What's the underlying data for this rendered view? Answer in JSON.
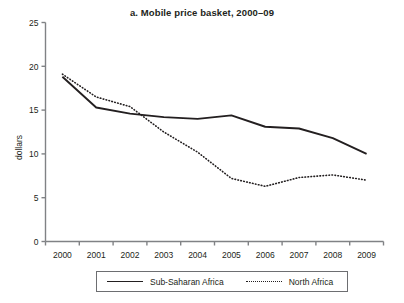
{
  "chart_data": {
    "type": "line",
    "title": "a. Mobile price basket, 2000–09",
    "xlabel": "",
    "ylabel": "dollars",
    "categories": [
      "2000",
      "2001",
      "2002",
      "2003",
      "2004",
      "2005",
      "2006",
      "2007",
      "2008",
      "2009"
    ],
    "x_tick_labels": [
      "2000",
      "2001",
      "2002",
      "2003",
      "2004",
      "2005",
      "2006",
      "2007",
      "2008",
      "2009"
    ],
    "y_tick_labels": [
      "0",
      "5",
      "10",
      "15",
      "20",
      "25"
    ],
    "y_ticks": [
      0,
      5,
      10,
      15,
      20,
      25
    ],
    "ylim": [
      0,
      25
    ],
    "grid": false,
    "legend_position": "bottom",
    "series": [
      {
        "name": "Sub-Saharan Africa",
        "style": "solid",
        "color": "#231f20",
        "values": [
          18.8,
          15.3,
          14.6,
          14.2,
          14.0,
          14.4,
          13.1,
          12.9,
          11.8,
          10.0
        ]
      },
      {
        "name": "North Africa",
        "style": "dotted",
        "color": "#231f20",
        "values": [
          19.1,
          16.5,
          15.4,
          12.5,
          10.2,
          7.2,
          6.3,
          7.3,
          7.6,
          7.0
        ]
      }
    ]
  },
  "axis": {
    "y_title": "dollars"
  },
  "legend": {
    "items": [
      {
        "label": "Sub-Saharan Africa",
        "style": "solid"
      },
      {
        "label": "North Africa",
        "style": "dotted"
      }
    ]
  }
}
